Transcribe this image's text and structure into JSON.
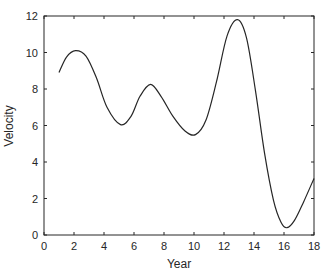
{
  "chart_data": {
    "type": "line",
    "title": "",
    "xlabel": "Year",
    "ylabel": "Velocity",
    "xlim": [
      0,
      18
    ],
    "ylim": [
      0,
      12
    ],
    "xticks": [
      0,
      2,
      4,
      6,
      8,
      10,
      12,
      14,
      16,
      18
    ],
    "yticks": [
      0,
      2,
      4,
      6,
      8,
      10,
      12
    ],
    "grid": false,
    "legend": null,
    "line_color": "#262626",
    "series": [
      {
        "name": "Velocity",
        "x": [
          1,
          1.5,
          2.1,
          2.8,
          3.5,
          4.2,
          5.1,
          5.8,
          6.4,
          7.1,
          7.8,
          8.6,
          9.4,
          10.1,
          10.8,
          11.5,
          12.2,
          12.9,
          13.5,
          14.1,
          14.7,
          15.3,
          15.8,
          16.2,
          16.7,
          17.3,
          18
        ],
        "y": [
          8.9,
          9.75,
          10.1,
          9.8,
          8.6,
          7.0,
          6.05,
          6.5,
          7.6,
          8.25,
          7.6,
          6.5,
          5.7,
          5.5,
          6.3,
          8.4,
          10.9,
          11.8,
          10.8,
          7.9,
          4.5,
          1.9,
          0.7,
          0.4,
          0.8,
          1.8,
          3.1
        ]
      }
    ]
  }
}
